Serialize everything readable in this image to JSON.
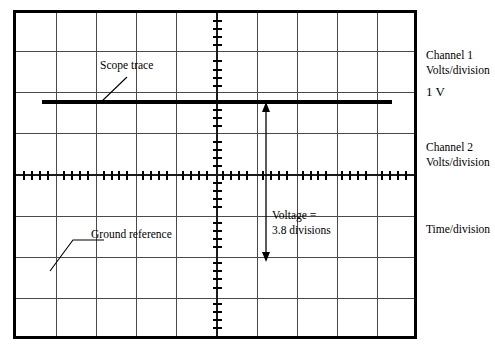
{
  "figure": {
    "type": "oscilloscope-screen-diagram"
  },
  "screen": {
    "divisions_horizontal": 10,
    "divisions_vertical": 8,
    "minor_ticks_per_division": 5
  },
  "annotations": {
    "scope_trace": "Scope trace",
    "ground_reference": "Ground reference",
    "voltage_line1": "Voltage =",
    "voltage_line2": "3.8 divisions"
  },
  "controls": {
    "channel1_line1": "Channel 1",
    "channel1_line2": "Volts/division",
    "channel1_value": "1 V",
    "channel2_line1": "Channel 2",
    "channel2_line2": "Volts/division",
    "time_division": "Time/division"
  },
  "chart_data": {
    "type": "line",
    "xlabel": "Time/division",
    "ylabel": "Volts/division",
    "xlim": [
      0,
      10
    ],
    "ylim": [
      0,
      8
    ],
    "grid": true,
    "legend": "none",
    "volts_per_division": "1 V",
    "measured_divisions": 3.8,
    "measured_voltage": "3.8 V",
    "series": [
      {
        "name": "Scope trace",
        "style": "solid-thick",
        "y_division_from_top": 2.15,
        "x_start_division": 0.32,
        "x_end_division": 9.0,
        "values": [
          2.15,
          2.15
        ]
      },
      {
        "name": "Ground reference",
        "style": "graticule-centre-line",
        "y_division_from_top": 4.0,
        "values": [
          4.0,
          4.0
        ]
      }
    ],
    "measurement_arrow": {
      "label": "Voltage = 3.8 divisions",
      "x_division": 6.35,
      "from_division_from_top": 2.2,
      "to_division_from_top": 6.0
    }
  }
}
